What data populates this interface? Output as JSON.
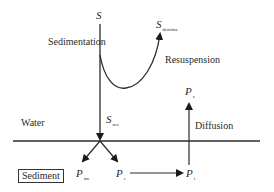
{
  "diagram": {
    "title": "",
    "labels": {
      "source": {
        "symbol": "S",
        "subscript": ""
      },
      "detritus": {
        "symbol": "S",
        "subscript": "detritus"
      },
      "net": {
        "symbol": "S",
        "subscript": "net"
      },
      "p_top": {
        "symbol": "P",
        "subscript": "s"
      },
      "p_im": {
        "symbol": "P",
        "subscript": "im"
      },
      "p_e": {
        "symbol": "P",
        "subscript": "e"
      },
      "p_i": {
        "symbol": "P",
        "subscript": "i"
      }
    },
    "processes": {
      "sedimentation": "Sedimentation",
      "resuspension": "Resuspension",
      "diffusion": "Diffusion"
    },
    "compartments": {
      "water": "Water",
      "sediment": "Sediment"
    },
    "line_color": "#2b2b2b"
  }
}
